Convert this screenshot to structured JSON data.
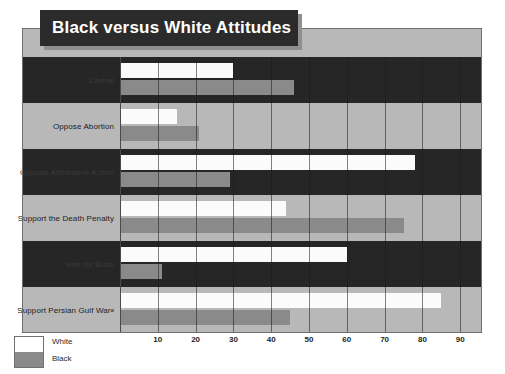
{
  "title": "Black versus White Attitudes",
  "legend": {
    "white_label": "White",
    "black_label": "Black",
    "white_color": "#ffffff",
    "black_color": "#8a8a8a"
  },
  "axis": {
    "caption": "PERCENT",
    "ticks": [
      "10",
      "20",
      "30",
      "40",
      "50",
      "60",
      "70",
      "80",
      "90"
    ]
  },
  "rows": [
    {
      "label": "Liberal",
      "footnote": "",
      "white": 30,
      "black": 46
    },
    {
      "label": "Oppose Abortion",
      "footnote": "",
      "white": 15,
      "black": 21
    },
    {
      "label": "Oppose Affirmative Action",
      "footnote": "",
      "white": 78,
      "black": 29
    },
    {
      "label": "Support the Death Penalty",
      "footnote": "",
      "white": 44,
      "black": 75
    },
    {
      "label": "Vote for Bush",
      "footnote": "",
      "white": 60,
      "black": 11
    },
    {
      "label": "Support Persian Gulf War",
      "footnote": "a",
      "white": 85,
      "black": 45
    }
  ],
  "chart_data": {
    "type": "bar",
    "orientation": "horizontal",
    "title": "Black versus White Attitudes",
    "xlabel": "PERCENT",
    "ylabel": "",
    "xlim": [
      0,
      100
    ],
    "xticks": [
      10,
      20,
      30,
      40,
      50,
      60,
      70,
      80,
      90
    ],
    "grid": true,
    "legend_position": "bottom-left",
    "categories": [
      "Liberal",
      "Oppose Abortion",
      "Oppose Affirmative Action",
      "Support the Death Penalty",
      "Vote for Bush",
      "Support Persian Gulf War"
    ],
    "series": [
      {
        "name": "White",
        "color": "#ffffff",
        "values": [
          30,
          15,
          78,
          44,
          60,
          85
        ]
      },
      {
        "name": "Black",
        "color": "#8a8a8a",
        "values": [
          46,
          21,
          29,
          75,
          11,
          45
        ]
      }
    ],
    "annotations": [
      "Support Persian Gulf War carries footnote marker a"
    ]
  }
}
